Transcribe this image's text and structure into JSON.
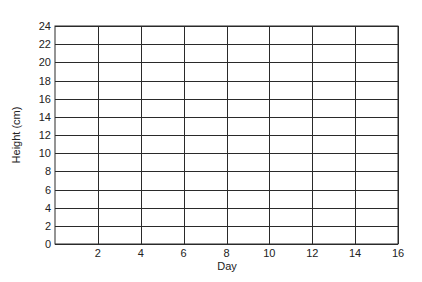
{
  "chart_data": {
    "type": "line",
    "title": "",
    "xlabel": "Day",
    "ylabel": "Height (cm)",
    "xlim": [
      0,
      16
    ],
    "ylim": [
      0,
      24
    ],
    "x_ticks": [
      2,
      4,
      6,
      8,
      10,
      12,
      14,
      16
    ],
    "y_ticks": [
      0,
      2,
      4,
      6,
      8,
      10,
      12,
      14,
      16,
      18,
      20,
      22,
      24
    ],
    "grid": true,
    "legend": null,
    "series": []
  }
}
